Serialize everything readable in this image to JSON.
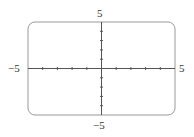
{
  "chart_data": {
    "type": "line",
    "title": "",
    "xlabel": "",
    "ylabel": "",
    "xlim": [
      -5,
      5
    ],
    "ylim": [
      -5,
      5
    ],
    "x_tick_step": 1,
    "y_tick_step": 1,
    "grid": false,
    "series": [],
    "labels": {
      "x_min": "−5",
      "x_max": "5",
      "y_min": "−5",
      "y_max": "5"
    }
  },
  "colors": {
    "axis": "#555555",
    "frame": "#888888"
  }
}
